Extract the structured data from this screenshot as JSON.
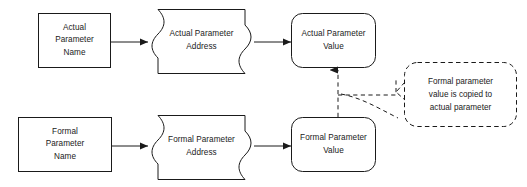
{
  "diagram": {
    "type": "flowchart",
    "background_color": "#ffffff",
    "stroke_color": "#1a1a1a",
    "text_color": "#1a1a1a",
    "nodes": [
      {
        "id": "actual-parameter-name",
        "shape": "rectangle",
        "lines": [
          "Actual",
          "Parameter",
          "Name"
        ],
        "x": 38,
        "y": 13,
        "w": 73,
        "h": 55
      },
      {
        "id": "actual-parameter-address",
        "shape": "concave-sided-box",
        "lines": [
          "Actual Parameter",
          "Address"
        ],
        "x": 148,
        "y": 9,
        "w": 107,
        "h": 65
      },
      {
        "id": "actual-parameter-value",
        "shape": "rounded-rectangle",
        "lines": [
          "Actual Parameter",
          "Value"
        ],
        "x": 291,
        "y": 13,
        "w": 85,
        "h": 55
      },
      {
        "id": "formal-parameter-name",
        "shape": "rectangle",
        "lines": [
          "Formal",
          "Parameter",
          "Name"
        ],
        "x": 18,
        "y": 117,
        "w": 94,
        "h": 55
      },
      {
        "id": "formal-parameter-address",
        "shape": "concave-sided-box",
        "lines": [
          "Formal Parameter",
          "Address"
        ],
        "x": 148,
        "y": 115,
        "w": 107,
        "h": 65
      },
      {
        "id": "formal-parameter-value",
        "shape": "rounded-rectangle",
        "lines": [
          "Formal Parameter",
          "Value"
        ],
        "x": 291,
        "y": 117,
        "w": 85,
        "h": 55
      }
    ],
    "callout": {
      "id": "copy-note",
      "style": "dashed-rounded-rectangle-with-tail",
      "lines": [
        "Formal parameter",
        "value is copied to",
        "actual parameter"
      ],
      "x": 404,
      "y": 62,
      "w": 113,
      "h": 65
    },
    "edges": [
      {
        "id": "actual-name-to-address",
        "from": "actual-parameter-name",
        "to": "actual-parameter-address",
        "style": "solid",
        "arrow": "filled-triangle",
        "direction": "right"
      },
      {
        "id": "actual-address-to-value",
        "from": "actual-parameter-address",
        "to": "actual-parameter-value",
        "style": "solid",
        "arrow": "filled-triangle",
        "direction": "right"
      },
      {
        "id": "formal-name-to-address",
        "from": "formal-parameter-name",
        "to": "formal-parameter-address",
        "style": "solid",
        "arrow": "filled-triangle",
        "direction": "right"
      },
      {
        "id": "formal-address-to-value",
        "from": "formal-parameter-address",
        "to": "formal-parameter-value",
        "style": "solid",
        "arrow": "filled-triangle",
        "direction": "right"
      },
      {
        "id": "formal-value-to-actual-value",
        "from": "formal-parameter-value",
        "to": "actual-parameter-value",
        "style": "dashed",
        "arrow": "filled-triangle",
        "direction": "up"
      },
      {
        "id": "callout-leader",
        "from": "copy-note",
        "to": "formal-value-to-actual-value",
        "style": "dashed",
        "arrow": "none",
        "direction": "left"
      }
    ]
  }
}
